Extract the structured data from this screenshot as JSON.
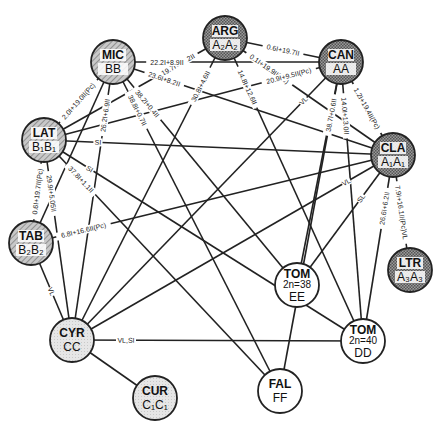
{
  "diagram": {
    "type": "genome-relationship-network",
    "colors": {
      "edge": "#222222",
      "node_stroke": "#222222",
      "a_genome_fill": "#8a8a8a",
      "b_genome_fill": "#b8b8b8",
      "c_genome_fill": "#e2e2e2",
      "tom_fill": "#ffffff",
      "label_plate": "#ffffff"
    },
    "nodes": [
      {
        "id": "ARG",
        "name": "ARG",
        "genome": "A2A2",
        "genome_display": "A₂A₂",
        "x": 225,
        "y": 38,
        "style": "a"
      },
      {
        "id": "MIC",
        "name": "MIC",
        "genome": "BB",
        "genome_display": "BB",
        "x": 113,
        "y": 62,
        "style": "b"
      },
      {
        "id": "CAN",
        "name": "CAN",
        "genome": "AA",
        "genome_display": "AA",
        "x": 341,
        "y": 62,
        "style": "a"
      },
      {
        "id": "LAT",
        "name": "LAT",
        "genome": "B1B1",
        "genome_display": "B₁B₁",
        "x": 44,
        "y": 140,
        "style": "b"
      },
      {
        "id": "CLA",
        "name": "CLA",
        "genome": "A1A1",
        "genome_display": "A₁A₁",
        "x": 393,
        "y": 155,
        "style": "a"
      },
      {
        "id": "TAB",
        "name": "TAB",
        "genome": "B2B2",
        "genome_display": "B₂B₂",
        "x": 31,
        "y": 243,
        "style": "b"
      },
      {
        "id": "LTR",
        "name": "LTR",
        "genome": "A3A3",
        "genome_display": "A₃A₃",
        "x": 410,
        "y": 270,
        "style": "a"
      },
      {
        "id": "TOM_EE",
        "name": "TOM",
        "sub": "2n=38",
        "genome": "EE",
        "genome_display": "EE",
        "x": 297,
        "y": 285,
        "style": "tom"
      },
      {
        "id": "CYR",
        "name": "CYR",
        "genome": "CC",
        "genome_display": "CC",
        "x": 72,
        "y": 340,
        "style": "c"
      },
      {
        "id": "TOM_DD",
        "name": "TOM",
        "sub": "2n=40",
        "genome": "DD",
        "genome_display": "DD",
        "x": 363,
        "y": 341,
        "style": "tom"
      },
      {
        "id": "CUR",
        "name": "CUR",
        "genome": "C1C1",
        "genome_display": "C₁C₁",
        "x": 155,
        "y": 398,
        "style": "c"
      },
      {
        "id": "FAL",
        "name": "FAL",
        "genome": "FF",
        "genome_display": "FF",
        "x": 280,
        "y": 391,
        "style": "tom"
      }
    ],
    "edges": [
      {
        "from": "ARG",
        "to": "CAN",
        "label": "0.6I+19.7II"
      },
      {
        "from": "ARG",
        "to": "CLA",
        "label": "0.1I+19.9II(Pc)"
      },
      {
        "from": "ARG",
        "to": "TOM_DD",
        "label": "14.8I+12.6II"
      },
      {
        "from": "ARG",
        "to": "LAT",
        "label": "19.7I+10.2II"
      },
      {
        "from": "ARG",
        "to": "CYR",
        "label": "30.8I+4.6II"
      },
      {
        "from": "MIC",
        "to": "CAN",
        "label": "22.2I+8.9II"
      },
      {
        "from": "MIC",
        "to": "CLA",
        "label": "23.6I+8.2II"
      },
      {
        "from": "MIC",
        "to": "LAT",
        "label": "2.0I+19.0II(Pc)"
      },
      {
        "from": "MIC",
        "to": "CYR",
        "label": "26.2I+6.9II"
      },
      {
        "from": "MIC",
        "to": "TOM_EE",
        "label": "38.2I+0.4II"
      },
      {
        "from": "MIC",
        "to": "FAL",
        "label": "38.8I+0.7II"
      },
      {
        "from": "MIC",
        "to": "TAB",
        "label": ""
      },
      {
        "from": "CAN",
        "to": "CLA",
        "label": "1.2I+19.4II(Pc)"
      },
      {
        "from": "CAN",
        "to": "LAT",
        "label": "20.9I+9.5II(Pc)"
      },
      {
        "from": "CAN",
        "to": "TOM_EE",
        "label": "30.0I+4.5II"
      },
      {
        "from": "CAN",
        "to": "TOM_DD",
        "label": "14.0I+13.0II"
      },
      {
        "from": "CAN",
        "to": "FAL",
        "label": "38.7I+0.6II"
      },
      {
        "from": "CAN",
        "to": "CYR",
        "label": "VL"
      },
      {
        "from": "LAT",
        "to": "CLA",
        "label": "SI"
      },
      {
        "from": "LAT",
        "to": "TAB",
        "label": "0.6I+19.7II(Pc)"
      },
      {
        "from": "LAT",
        "to": "CYR",
        "label": "29.9I+5.05II"
      },
      {
        "from": "LAT",
        "to": "TOM_DD",
        "label": "SI"
      },
      {
        "from": "LAT",
        "to": "FAL",
        "label": "37.8I+1.1II"
      },
      {
        "from": "TAB",
        "to": "CLA",
        "label": "6.8I+16.6II(Pc)"
      },
      {
        "from": "TAB",
        "to": "CYR",
        "label": "VL"
      },
      {
        "from": "CLA",
        "to": "LTR",
        "label": "7.9I+16.1II(Pc)VL"
      },
      {
        "from": "CLA",
        "to": "TOM_EE",
        "label": "SL"
      },
      {
        "from": "CLA",
        "to": "CYR",
        "label": "VL"
      },
      {
        "from": "CLA",
        "to": "TOM_DD",
        "label": "26.6I+6.2II"
      },
      {
        "from": "CYR",
        "to": "TOM_DD",
        "label": "VL,SI"
      },
      {
        "from": "CYR",
        "to": "CUR",
        "label": ""
      }
    ]
  }
}
